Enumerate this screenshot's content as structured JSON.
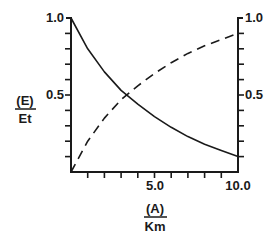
{
  "chart_data": {
    "type": "line",
    "title": "",
    "xlabel": "(A)/Km",
    "ylabel": "(E)/Et",
    "xlim": [
      0,
      10
    ],
    "ylim": [
      0,
      1
    ],
    "x_tick_labels": [
      "5.0",
      "10.0"
    ],
    "y_tick_labels": [
      "0.5",
      "1.0"
    ],
    "grid": false,
    "legend": "none",
    "x": [
      0,
      1,
      2,
      3,
      4,
      5,
      6,
      7,
      8,
      9,
      10
    ],
    "series": [
      {
        "name": "solid",
        "style": "solid",
        "values": [
          1.0,
          0.8,
          0.65,
          0.53,
          0.44,
          0.36,
          0.29,
          0.23,
          0.18,
          0.14,
          0.1
        ]
      },
      {
        "name": "dashed",
        "style": "dashed",
        "values": [
          0.0,
          0.2,
          0.35,
          0.47,
          0.56,
          0.64,
          0.71,
          0.77,
          0.82,
          0.86,
          0.9
        ]
      }
    ]
  },
  "labels": {
    "y_num": "(E)",
    "y_den": "Et",
    "x_num": "(A)",
    "x_den": "Km",
    "y_top_left": "1.0",
    "y_mid_left": "0.5",
    "y_top_right": "1.0",
    "y_mid_right": "0.5",
    "x_mid": "5.0",
    "x_end": "10.0"
  }
}
